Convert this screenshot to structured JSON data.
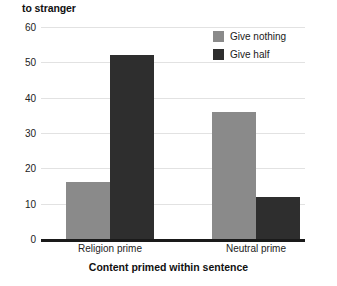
{
  "chart_data": {
    "type": "bar",
    "title": "to stranger",
    "title_note": "cropped y-axis title fragment shown at top-left",
    "categories": [
      "Religion prime",
      "Neutral prime"
    ],
    "series": [
      {
        "name": "Give nothing",
        "values": [
          16,
          36
        ],
        "color": "#8a8a8a"
      },
      {
        "name": "Give half",
        "values": [
          52,
          12
        ],
        "color": "#2e2e2e"
      }
    ],
    "xlabel": "Content primed within sentence",
    "ylabel": "",
    "ylim": [
      0,
      60
    ],
    "ytick_step": 10,
    "yticks": [
      "0",
      "10",
      "20",
      "30",
      "40",
      "50",
      "60"
    ],
    "grid": true,
    "legend_position": "top-right"
  },
  "legend": {
    "items": [
      {
        "label": "Give nothing",
        "color": "#8a8a8a"
      },
      {
        "label": "Give half",
        "color": "#2e2e2e"
      }
    ]
  },
  "colors": {
    "gridline": "#e2e2e2",
    "axis": "#1a1a1a",
    "background": "#ffffff",
    "text": "#111111"
  }
}
